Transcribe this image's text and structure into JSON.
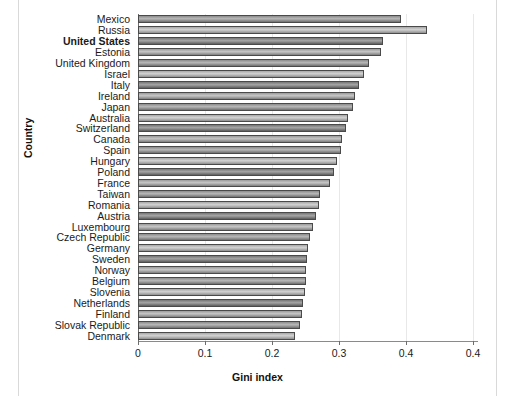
{
  "chart_data": {
    "type": "bar",
    "orientation": "horizontal",
    "title": "",
    "xlabel": "Gini index",
    "ylabel": "Country",
    "xlim": [
      0,
      0.4
    ],
    "xticks": [
      "0",
      "0.1",
      "0.2",
      "0.3",
      "0.4",
      "0.4"
    ],
    "xtick_values": [
      0,
      0.1,
      0.2,
      0.3,
      0.4,
      0.5
    ],
    "grid": "vertical",
    "legend": "none",
    "categories": [
      "Mexico",
      "Russia",
      "United States",
      "Estonia",
      "United Kingdom",
      "Israel",
      "Italy",
      "Ireland",
      "Japan",
      "Australia",
      "Switzerland",
      "Canada",
      "Spain",
      "Hungary",
      "Poland",
      "France",
      "Taiwan",
      "Romania",
      "Austria",
      "Luxembourg",
      "Czech Republic",
      "Germany",
      "Sweden",
      "Norway",
      "Belgium",
      "Slovenia",
      "Netherlands",
      "Finland",
      "Slovak Republic",
      "Denmark"
    ],
    "values": [
      0.393,
      0.432,
      0.366,
      0.362,
      0.345,
      0.337,
      0.33,
      0.324,
      0.321,
      0.313,
      0.31,
      0.305,
      0.303,
      0.297,
      0.293,
      0.286,
      0.272,
      0.27,
      0.266,
      0.261,
      0.256,
      0.254,
      0.252,
      0.251,
      0.25,
      0.249,
      0.247,
      0.245,
      0.242,
      0.235
    ],
    "highlighted_category": "United States",
    "bar_edge_color": "#4a4a4a"
  }
}
